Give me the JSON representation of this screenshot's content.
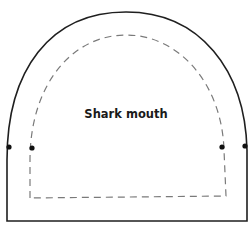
{
  "diagram": {
    "label": "Shark mouth",
    "colors": {
      "outline": "#1f1f1f",
      "dashed": "#7a7a7a",
      "dot": "#111111",
      "background": "#ffffff"
    },
    "markers": [
      {
        "name": "outer-left-dot",
        "x": 9,
        "y": 147
      },
      {
        "name": "inner-left-dot",
        "x": 32,
        "y": 148
      },
      {
        "name": "inner-right-dot",
        "x": 222,
        "y": 147
      },
      {
        "name": "outer-right-dot",
        "x": 245,
        "y": 146
      }
    ]
  }
}
